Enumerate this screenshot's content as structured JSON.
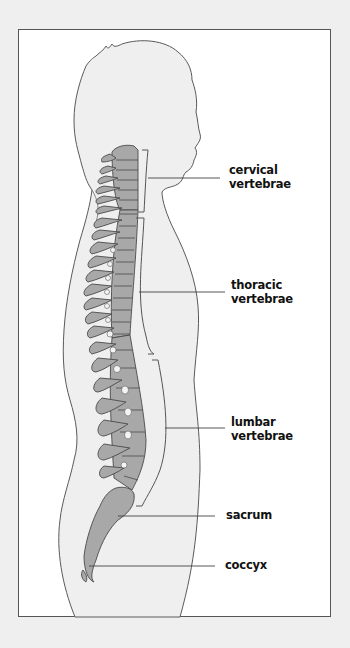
{
  "figure": {
    "labels": [
      {
        "id": "cervical",
        "line1": "cervical",
        "line2": "vertebrae"
      },
      {
        "id": "thoracic",
        "line1": "thoracic",
        "line2": "vertebrae"
      },
      {
        "id": "lumbar",
        "line1": "lumbar",
        "line2": "vertebrae"
      },
      {
        "id": "sacrum",
        "line1": "sacrum",
        "line2": ""
      },
      {
        "id": "coccyx",
        "line1": "coccyx",
        "line2": ""
      }
    ]
  },
  "colors": {
    "background": "#efefef",
    "frame": "#ffffff",
    "body_fill": "#efefef",
    "bone_fill": "#a8a8a8",
    "outline": "#555555",
    "text": "#111111"
  }
}
